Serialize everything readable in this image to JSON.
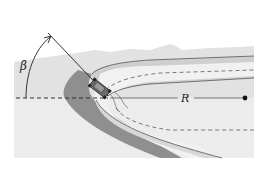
{
  "figure": {
    "labels": {
      "angle": "β",
      "radius": "R"
    },
    "colors": {
      "background": "#ffffff",
      "ground_light": "#e3e3e3",
      "ground_mid": "#d4d4d4",
      "road_far": "#c9c9c9",
      "road_near": "#d9d9d9",
      "shadow": "#8e8e8e",
      "inner_track": "#f1f1f1",
      "line": "#333333",
      "dashed": "#7a7a7a"
    }
  }
}
